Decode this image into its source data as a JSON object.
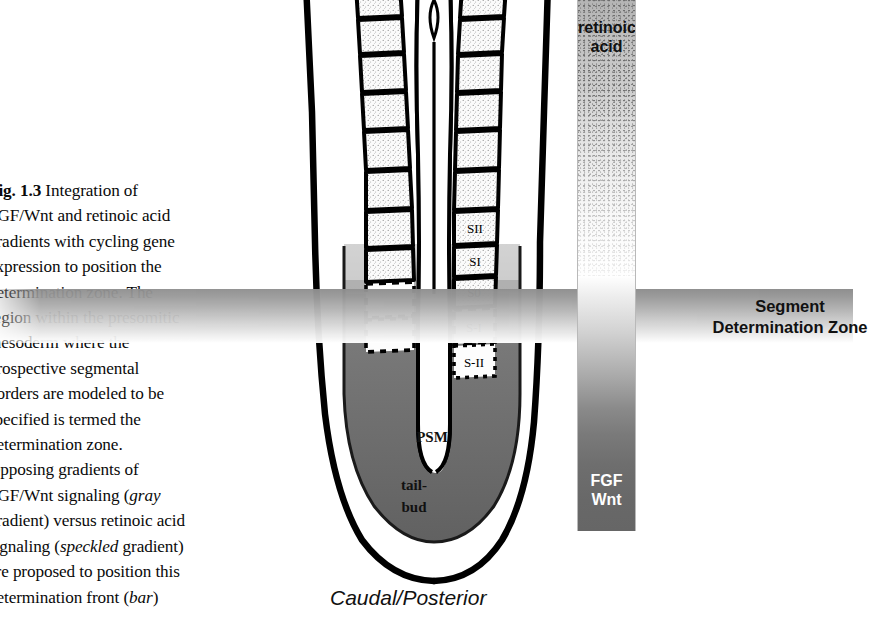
{
  "caption": {
    "figure_number": "Fig. 1.3",
    "lines": [
      {
        "text": "Fig. 1.3",
        "bold": true,
        "suffix": "  Integration of"
      },
      {
        "text": "FGF/Wnt and retinoic acid"
      },
      {
        "text": "gradients with cycling gene"
      },
      {
        "text": "expression to position the"
      },
      {
        "text": "determination zone. The"
      },
      {
        "text": "region within the presomitic"
      },
      {
        "text": "mesoderm where the"
      },
      {
        "text": "prospective segmental"
      },
      {
        "text": "borders are modeled to be"
      },
      {
        "text": "specified is termed the"
      },
      {
        "text": "determination zone."
      },
      {
        "text": "Opposing gradients of"
      },
      {
        "text": "FGF/Wnt signaling (",
        "italic": "gray",
        "after": ""
      },
      {
        "text": "gradient) versus retinoic acid"
      },
      {
        "text": "signaling (",
        "italic": "speckled",
        "after": " gradient)"
      },
      {
        "text": "are proposed to position this"
      },
      {
        "text": "determination front (",
        "italic": "bar",
        "after": ")"
      }
    ]
  },
  "embryo": {
    "somite_labels": [
      "SII",
      "SI",
      "S0",
      "S-I",
      "S-II"
    ],
    "psm_label": "PSM",
    "tailbud_label": "tail-bud",
    "axis_label": "Caudal/Posterior"
  },
  "gradient_bar": {
    "top_label_line1": "retinoic",
    "top_label_line2": "acid",
    "bottom_label_line1": "FGF",
    "bottom_label_line2": "Wnt"
  },
  "determination_zone": {
    "line1": "Segment",
    "line2": "Determination Zone"
  },
  "colors": {
    "ink": "#000000",
    "band_dark": "#8f8f8f",
    "tailbud_fill": "#5a5a5a",
    "psm_fill": "#6f6f6f"
  }
}
